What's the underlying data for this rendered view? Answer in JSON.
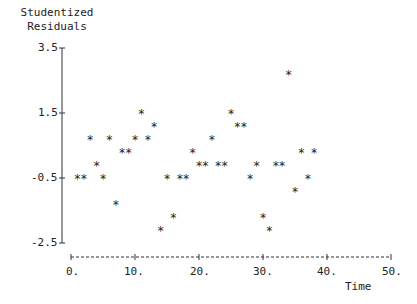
{
  "chart_data": {
    "type": "scatter",
    "title": "",
    "ylabel_lines": [
      "Studentized",
      "Residuals"
    ],
    "xlabel": "Time",
    "xlim": [
      0,
      50
    ],
    "ylim": [
      -2.5,
      3.5
    ],
    "xticks": [
      "0.",
      "10.",
      "20.",
      "30.",
      "40.",
      "50."
    ],
    "yticks": [
      "3.5",
      "1.5",
      "-0.5",
      "-2.5"
    ],
    "marker": "*",
    "grid": false,
    "legend": null,
    "x": [
      1,
      2,
      3,
      4,
      5,
      6,
      7,
      8,
      9,
      10,
      11,
      12,
      13,
      14,
      15,
      16,
      17,
      18,
      19,
      20,
      21,
      22,
      23,
      24,
      25,
      26,
      27,
      28,
      29,
      30,
      31,
      32,
      33,
      34,
      35,
      36,
      37,
      38
    ],
    "y": [
      -0.5,
      -0.5,
      0.7,
      -0.1,
      -0.5,
      0.7,
      -1.3,
      0.3,
      0.3,
      0.7,
      1.5,
      0.7,
      1.1,
      -2.1,
      -0.5,
      -1.7,
      -0.5,
      -0.5,
      0.3,
      -0.1,
      -0.1,
      0.7,
      -0.1,
      -0.1,
      1.5,
      1.1,
      1.1,
      -0.5,
      -0.1,
      -1.7,
      -2.1,
      -0.1,
      -0.1,
      2.7,
      -0.9,
      0.3,
      -0.5,
      0.3
    ]
  }
}
